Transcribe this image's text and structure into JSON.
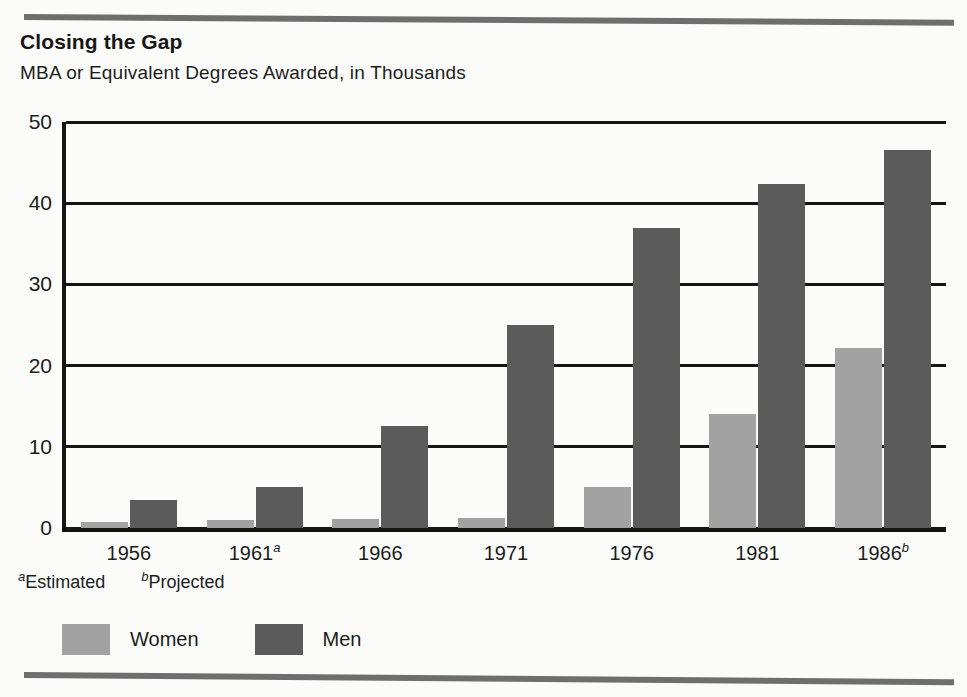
{
  "header": {
    "title": "Closing the Gap",
    "subtitle": "MBA or Equivalent Degrees Awarded, in Thousands"
  },
  "footnotes": [
    {
      "marker": "a",
      "text": "Estimated"
    },
    {
      "marker": "b",
      "text": "Projected"
    }
  ],
  "legend": {
    "position": "bottom-left",
    "items": [
      {
        "label": "Women",
        "color": "#a2a2a2"
      },
      {
        "label": "Men",
        "color": "#5b5b5b"
      }
    ]
  },
  "chart_data": {
    "type": "bar",
    "title": "Closing the Gap",
    "subtitle": "MBA or Equivalent Degrees Awarded, in Thousands",
    "xlabel": "",
    "ylabel": "",
    "ylim": [
      0,
      50
    ],
    "yticks": [
      "0",
      "10",
      "20",
      "30",
      "40",
      "50"
    ],
    "ytick_values": [
      0,
      10,
      20,
      30,
      40,
      50
    ],
    "grid": true,
    "grid_axis": "y",
    "categories": [
      "1956",
      "1961",
      "1966",
      "1971",
      "1976",
      "1981",
      "1986"
    ],
    "category_markers": [
      "",
      "a",
      "",
      "",
      "",
      "",
      "b"
    ],
    "series": [
      {
        "name": "Women",
        "color": "#a2a2a2",
        "values": [
          0.8,
          1.0,
          1.1,
          1.2,
          5.0,
          14.1,
          22.2
        ]
      },
      {
        "name": "Men",
        "color": "#5b5b5b",
        "values": [
          3.5,
          5.0,
          12.6,
          25.0,
          37.0,
          42.4,
          46.6
        ]
      }
    ]
  }
}
